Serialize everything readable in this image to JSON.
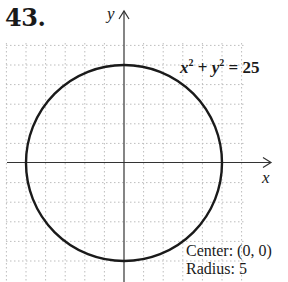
{
  "problem": {
    "number": "43."
  },
  "graph": {
    "x_axis_label": "x",
    "y_axis_label": "y",
    "equation": {
      "x_var": "x",
      "y_var": "y",
      "exponent": "2",
      "plus": " + ",
      "equals": " = 25"
    },
    "equation_text": "x^2 + y^2 = 25",
    "annotation": {
      "center_line": "Center: (0, 0)",
      "radius_line": "Radius: 5"
    },
    "grid": {
      "x_min": -6,
      "x_max": 7,
      "y_min": -6,
      "y_max": 6,
      "step": 1,
      "style": "dotted"
    },
    "circle": {
      "center_x": 0,
      "center_y": 0,
      "radius": 5
    },
    "colors": {
      "curve": "#1a1a1a",
      "axes": "#333333",
      "grid": "#b8b8b8"
    }
  }
}
